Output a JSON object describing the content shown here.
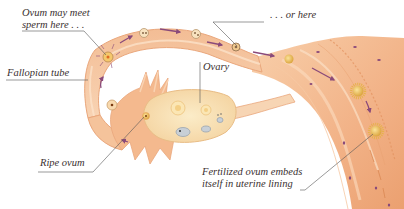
{
  "diagram": {
    "colors": {
      "tissue_light": "#f9d9bd",
      "tissue_mid": "#f4b98e",
      "tissue_dark": "#e99a68",
      "tube_edge": "#eaa77c",
      "ovary": "#f7e2b8",
      "ovum": "#e8b64a",
      "arrow": "#8a4a7a",
      "leader_line": "#555555",
      "text": "#3a3030"
    },
    "labels": {
      "meet": {
        "line1": "Ovum may meet",
        "line2": "sperm here . . ."
      },
      "or_here": " . . . or here",
      "fallopian_tube": "Fallopian tube",
      "ovary": "Ovary",
      "ripe_ovum": "Ripe ovum",
      "embed": {
        "line1": "Fertilized ovum embeds",
        "line2": "itself  in uterine lining"
      }
    }
  }
}
